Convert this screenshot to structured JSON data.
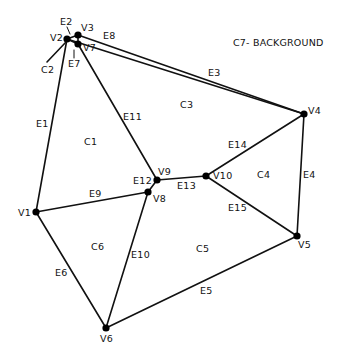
{
  "title": "C7- BACKGROUND",
  "colors": {
    "ink": "#111111",
    "background": "#ffffff"
  },
  "vertices": [
    {
      "id": "V1",
      "label": "V1",
      "x": 36,
      "y": 212,
      "lx": 18,
      "ly": 216
    },
    {
      "id": "V2",
      "label": "V2",
      "x": 67,
      "y": 39,
      "lx": 50,
      "ly": 41
    },
    {
      "id": "V3",
      "label": "V3",
      "x": 78,
      "y": 35,
      "lx": 81,
      "ly": 31
    },
    {
      "id": "V4",
      "label": "V4",
      "x": 304,
      "y": 114,
      "lx": 308,
      "ly": 114
    },
    {
      "id": "V5",
      "label": "V5",
      "x": 297,
      "y": 236,
      "lx": 298,
      "ly": 248
    },
    {
      "id": "V6",
      "label": "V6",
      "x": 106,
      "y": 328,
      "lx": 100,
      "ly": 342
    },
    {
      "id": "V7",
      "label": "V7",
      "x": 78,
      "y": 44,
      "lx": 83,
      "ly": 51
    },
    {
      "id": "V8",
      "label": "V8",
      "x": 148,
      "y": 192,
      "lx": 153,
      "ly": 202
    },
    {
      "id": "V9",
      "label": "V9",
      "x": 157,
      "y": 180,
      "lx": 158,
      "ly": 175
    },
    {
      "id": "V10",
      "label": "V10",
      "x": 206,
      "y": 176,
      "lx": 213,
      "ly": 179
    }
  ],
  "edges": [
    {
      "id": "E1",
      "label": "E1",
      "from": "V1",
      "to": "V2",
      "lx": 36,
      "ly": 127
    },
    {
      "id": "E2",
      "label": "E2",
      "from": "V2",
      "to": "V3",
      "lx": 60,
      "ly": 25
    },
    {
      "id": "E3",
      "label": "E3",
      "from": "V3",
      "to": "V4",
      "lx": 208,
      "ly": 76
    },
    {
      "id": "E4",
      "label": "E4",
      "from": "V4",
      "to": "V5",
      "lx": 303,
      "ly": 178
    },
    {
      "id": "E5",
      "label": "E5",
      "from": "V5",
      "to": "V6",
      "lx": 200,
      "ly": 294
    },
    {
      "id": "E6",
      "label": "E6",
      "from": "V1",
      "to": "V6",
      "lx": 55,
      "ly": 276
    },
    {
      "id": "E7",
      "label": "E7",
      "from": "V7",
      "to": "V2",
      "lx": 68,
      "ly": 67
    },
    {
      "id": "E8",
      "label": "E8",
      "from": "V3",
      "to": "V7",
      "lx": 103,
      "ly": 39
    },
    {
      "id": "E9",
      "label": "E9",
      "from": "V1",
      "to": "V8",
      "lx": 89,
      "ly": 197
    },
    {
      "id": "E10",
      "label": "E10",
      "from": "V8",
      "to": "V6",
      "lx": 131,
      "ly": 258
    },
    {
      "id": "E11",
      "label": "E11",
      "from": "V7",
      "to": "V9",
      "lx": 123,
      "ly": 120
    },
    {
      "id": "E12",
      "label": "E12",
      "from": "V8",
      "to": "V9",
      "lx": 133,
      "ly": 184
    },
    {
      "id": "E13",
      "label": "E13",
      "from": "V9",
      "to": "V10",
      "lx": 177,
      "ly": 189
    },
    {
      "id": "E14",
      "label": "E14",
      "from": "V10",
      "to": "V4",
      "lx": 228,
      "ly": 148
    },
    {
      "id": "E15",
      "label": "E15",
      "from": "V10",
      "to": "V5",
      "lx": 228,
      "ly": 211
    }
  ],
  "extra_edges": [
    {
      "id": "V2-V3-cross",
      "from": "V2",
      "to": "V4"
    }
  ],
  "cells": [
    {
      "id": "C1",
      "label": "C1",
      "x": 84,
      "y": 145
    },
    {
      "id": "C2",
      "label": "C2",
      "x": 41,
      "y": 73
    },
    {
      "id": "C3",
      "label": "C3",
      "x": 180,
      "y": 108
    },
    {
      "id": "C4",
      "label": "C4",
      "x": 257,
      "y": 178
    },
    {
      "id": "C5",
      "label": "C5",
      "x": 196,
      "y": 252
    },
    {
      "id": "C6",
      "label": "C6",
      "x": 91,
      "y": 250
    }
  ]
}
